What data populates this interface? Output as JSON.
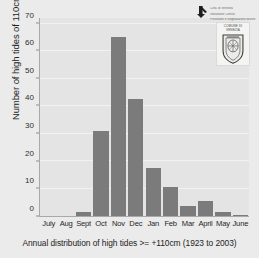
{
  "chart_data": {
    "type": "bar",
    "title": "",
    "caption": "Annual distribution of high tides >= +110cm (1923 to 2003)",
    "xlabel": "",
    "ylabel": "Number of high tides of 110cms or above",
    "categories": [
      "July",
      "Aug",
      "Sept",
      "Oct",
      "Nov",
      "Dec",
      "Jan",
      "Feb",
      "Mar",
      "April",
      "May",
      "June"
    ],
    "values": [
      0,
      0,
      1.5,
      31,
      65,
      42.5,
      17.5,
      10.5,
      3.5,
      5.5,
      1.5,
      0.3
    ],
    "ylim": [
      0,
      72
    ],
    "yticks": [
      0,
      10,
      20,
      30,
      40,
      50,
      60,
      70
    ],
    "grid": true,
    "legend": "none",
    "bar_color": "#7b7b7b",
    "plot_background": "#e4e4e4",
    "figure_background": "#ebebeb",
    "gridline_color": "#f2f2f2",
    "axis_color": "#a8a8a8"
  },
  "logo": {
    "text_lines": [
      "Citta' di Venezia",
      "Istituzione Centro",
      "Previsioni e Segnalazioni Maree"
    ],
    "crest_lines": [
      "COMUNE DI",
      "VENEZIA"
    ]
  }
}
